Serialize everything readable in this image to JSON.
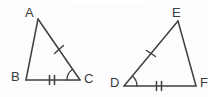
{
  "figure": {
    "background_color": "#fdfdfd",
    "stroke_color": "#3f3f44",
    "triangles": [
      {
        "name": "triangle-abc",
        "vertices": [
          {
            "label": "A",
            "x": 38,
            "y": 19,
            "label_x": 25,
            "label_y": 6
          },
          {
            "label": "B",
            "x": 26,
            "y": 80,
            "label_x": 11,
            "label_y": 70
          },
          {
            "label": "C",
            "x": 80,
            "y": 80,
            "label_x": 84,
            "label_y": 72
          }
        ],
        "sides": [
          {
            "name": "side-ab",
            "from": "A",
            "to": "B",
            "ticks": 0
          },
          {
            "name": "side-ac",
            "from": "A",
            "to": "C",
            "ticks": 1
          },
          {
            "name": "side-bc",
            "from": "B",
            "to": "C",
            "ticks": 2
          }
        ],
        "angle_marks": [
          {
            "name": "angle-c",
            "at": "C",
            "arcs": 1
          }
        ]
      },
      {
        "name": "triangle-def",
        "vertices": [
          {
            "label": "E",
            "x": 178,
            "y": 21,
            "label_x": 172,
            "label_y": 6
          },
          {
            "label": "D",
            "x": 124,
            "y": 86,
            "label_x": 110,
            "label_y": 76
          },
          {
            "label": "F",
            "x": 196,
            "y": 86,
            "label_x": 200,
            "label_y": 76
          }
        ],
        "sides": [
          {
            "name": "side-de",
            "from": "D",
            "to": "E",
            "ticks": 1
          },
          {
            "name": "side-ef",
            "from": "E",
            "to": "F",
            "ticks": 0
          },
          {
            "name": "side-df",
            "from": "D",
            "to": "F",
            "ticks": 2
          }
        ],
        "angle_marks": [
          {
            "name": "angle-d",
            "at": "D",
            "arcs": 1
          }
        ]
      }
    ]
  }
}
